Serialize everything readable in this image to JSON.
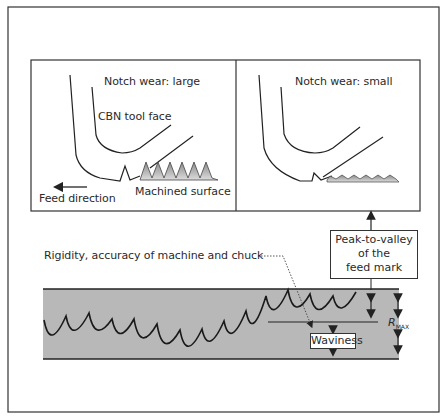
{
  "panels": {
    "left": {
      "title": "Notch wear: large",
      "tool_label": "CBN tool face",
      "surface_label": "Machined surface",
      "feed_label": "Feed direction"
    },
    "right": {
      "title": "Notch wear: small"
    }
  },
  "profile": {
    "rigidity_label": "Rigidity, accuracy of machine and chuck",
    "peak_box_line1": "Peak-to-valley",
    "peak_box_line2": "of the",
    "peak_box_line3": "feed mark",
    "waviness_label": "Waviness",
    "rmax_label": "R",
    "rmax_sub": "MAX"
  },
  "colors": {
    "band_fill": "#b8b8b8",
    "stroke": "#222222",
    "surface_fill": "#bdbdbd"
  }
}
